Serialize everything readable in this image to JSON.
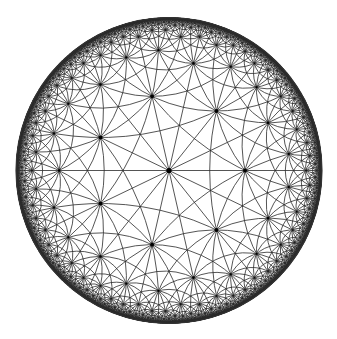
{
  "figure": {
    "type": "poincare-disk-tiling",
    "triangle_group": {
      "p": 7,
      "q": 3,
      "r": 2
    },
    "disk": {
      "cx": 169,
      "cy": 170.5,
      "radius": 153
    },
    "style": {
      "background": "#ffffff",
      "line_color": "#2a2a2a",
      "line_width": 0.8,
      "boundary_color": "#333333",
      "boundary_width": 1.2,
      "vertex_dot_color": "#000000",
      "vertex_dot_radius": 2.6
    },
    "limits": {
      "min_chord": 0.012,
      "max_geodesics": 7000,
      "max_vertex_abs": 0.985
    }
  },
  "caption_fragment": ""
}
